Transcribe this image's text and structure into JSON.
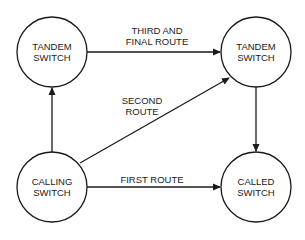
{
  "diagram": {
    "type": "network-routing-diagram",
    "colors": {
      "stroke": "#1a1a1a",
      "background": "#ffffff"
    },
    "nodes": [
      {
        "id": "tandem_left",
        "label": "TANDEM\nSWITCH"
      },
      {
        "id": "tandem_right",
        "label": "TANDEM\nSWITCH"
      },
      {
        "id": "calling",
        "label": "CALLING\nSWITCH"
      },
      {
        "id": "called",
        "label": "CALLED\nSWITCH"
      }
    ],
    "edges": [
      {
        "from": "calling",
        "to": "called",
        "label": "FIRST ROUTE"
      },
      {
        "from": "calling",
        "to": "tandem_right",
        "label": "SECOND\nROUTE"
      },
      {
        "from": "tandem_left",
        "to": "tandem_right",
        "label": "THIRD AND\nFINAL ROUTE"
      },
      {
        "from": "calling",
        "to": "tandem_left",
        "label": ""
      },
      {
        "from": "tandem_right",
        "to": "called",
        "label": ""
      }
    ]
  }
}
